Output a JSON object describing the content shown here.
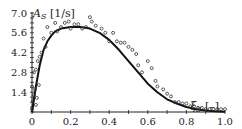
{
  "chart_data": {
    "type": "scatter",
    "title": "",
    "xlabel": "ξ_S [–]",
    "ylabel": "A_S [1/s]",
    "xlim": [
      0,
      1.0
    ],
    "ylim": [
      0,
      7.0
    ],
    "x_ticks": [
      "0",
      "0.2",
      "0.4",
      "0.6",
      "0.8",
      "1.0"
    ],
    "y_ticks": [
      "1.4",
      "2.8",
      "4.2",
      "5.6",
      "7.0"
    ],
    "grid": false,
    "legend": null,
    "series": [
      {
        "name": "measured",
        "type": "scatter",
        "marker": "open-circle",
        "x": [
          0.0,
          0.0,
          0.005,
          0.01,
          0.01,
          0.015,
          0.02,
          0.02,
          0.025,
          0.03,
          0.035,
          0.04,
          0.05,
          0.06,
          0.07,
          0.08,
          0.1,
          0.12,
          0.13,
          0.15,
          0.17,
          0.19,
          0.2,
          0.22,
          0.24,
          0.26,
          0.28,
          0.3,
          0.31,
          0.33,
          0.36,
          0.38,
          0.4,
          0.42,
          0.44,
          0.46,
          0.48,
          0.5,
          0.52,
          0.54,
          0.55,
          0.57,
          0.6,
          0.62,
          0.64,
          0.65,
          0.68,
          0.7,
          0.72,
          0.74,
          0.76,
          0.78,
          0.8,
          0.82,
          0.84,
          0.86,
          0.88,
          0.9,
          0.92,
          0.94,
          0.96,
          0.98,
          1.0
        ],
        "y": [
          0.2,
          1.8,
          0.8,
          1.2,
          2.8,
          1.6,
          0.5,
          3.0,
          1.0,
          3.6,
          1.9,
          3.9,
          4.2,
          5.2,
          4.6,
          6.0,
          5.6,
          6.3,
          5.7,
          6.0,
          6.3,
          6.4,
          5.9,
          6.2,
          6.2,
          5.9,
          6.0,
          6.7,
          6.4,
          6.1,
          5.9,
          5.6,
          5.0,
          5.6,
          5.0,
          4.9,
          4.9,
          4.6,
          4.4,
          4.1,
          3.3,
          2.8,
          3.6,
          3.1,
          2.2,
          1.8,
          1.6,
          1.3,
          1.1,
          0.7,
          0.7,
          0.6,
          0.6,
          0.4,
          0.4,
          0.3,
          0.3,
          0.2,
          0.2,
          0.2,
          0.2,
          0.2,
          0.2
        ]
      },
      {
        "name": "fit",
        "type": "line",
        "x": [
          0.0,
          0.02,
          0.04,
          0.06,
          0.08,
          0.1,
          0.12,
          0.15,
          0.2,
          0.25,
          0.3,
          0.35,
          0.4,
          0.45,
          0.5,
          0.55,
          0.6,
          0.65,
          0.7,
          0.75,
          0.8,
          0.85,
          0.9,
          0.95,
          1.0
        ],
        "y": [
          0.0,
          1.8,
          3.3,
          4.4,
          5.0,
          5.4,
          5.7,
          5.9,
          6.0,
          6.0,
          5.9,
          5.6,
          5.1,
          4.4,
          3.6,
          2.8,
          2.0,
          1.4,
          0.9,
          0.6,
          0.35,
          0.2,
          0.1,
          0.05,
          0.02
        ]
      }
    ]
  },
  "labels": {
    "y_axis_symbol": "A",
    "y_axis_sub": "S",
    "y_axis_unit": " [1/s]",
    "x_axis_symbol": "ξ",
    "x_axis_sub": "S",
    "x_axis_unit": " [–]"
  }
}
